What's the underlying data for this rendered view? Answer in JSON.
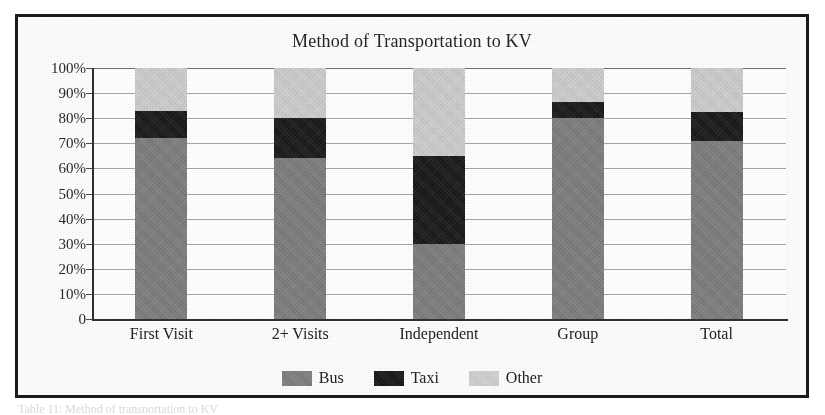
{
  "figure": {
    "title": "Method of Transportation to KV",
    "caption_remnant": "Table 11: Method of transportation to KV"
  },
  "colors": {
    "bus": "#7f7f7f",
    "taxi": "#161616",
    "other": "#d2d2d2",
    "frame": "#1b1b1b",
    "gridline": "#8a8a8a",
    "axis": "#2f2f2f"
  },
  "axis": {
    "y_ticks": [
      "100%",
      "90%",
      "80%",
      "70%",
      "60%",
      "50%",
      "40%",
      "30%",
      "20%",
      "10%",
      "0"
    ],
    "y_values": [
      100,
      90,
      80,
      70,
      60,
      50,
      40,
      30,
      20,
      10,
      0
    ]
  },
  "legend": {
    "items": [
      {
        "label": "Bus",
        "swatch": "bus-swatch"
      },
      {
        "label": "Taxi",
        "swatch": "taxi-swatch"
      },
      {
        "label": "Other",
        "swatch": "other-swatch"
      }
    ]
  },
  "chart_data": {
    "type": "bar",
    "stacked": true,
    "stack_mode": "percent",
    "title": "Method of Transportation to KV",
    "xlabel": "",
    "ylabel": "",
    "ylim": [
      0,
      100
    ],
    "yticks": [
      0,
      10,
      20,
      30,
      40,
      50,
      60,
      70,
      80,
      90,
      100
    ],
    "ytick_labels": [
      "0",
      "10%",
      "20%",
      "30%",
      "40%",
      "50%",
      "60%",
      "70%",
      "80%",
      "90%",
      "100%"
    ],
    "grid": true,
    "legend_position": "bottom",
    "categories": [
      "First Visit",
      "2+ Visits",
      "Independent",
      "Group",
      "Total"
    ],
    "series": [
      {
        "name": "Bus",
        "color": "#7f7f7f",
        "values": [
          72,
          64,
          30,
          80,
          71
        ]
      },
      {
        "name": "Taxi",
        "color": "#161616",
        "values": [
          11,
          16,
          35,
          6.5,
          11.5
        ]
      },
      {
        "name": "Other",
        "color": "#d2d2d2",
        "values": [
          17,
          20,
          35,
          13.5,
          17.5
        ]
      }
    ],
    "cumulative_tops": {
      "Bus": [
        72,
        64,
        30,
        80,
        71
      ],
      "Taxi": [
        83,
        80,
        65,
        86.5,
        82.5
      ],
      "Other": [
        100,
        100,
        100,
        100,
        100
      ]
    }
  }
}
